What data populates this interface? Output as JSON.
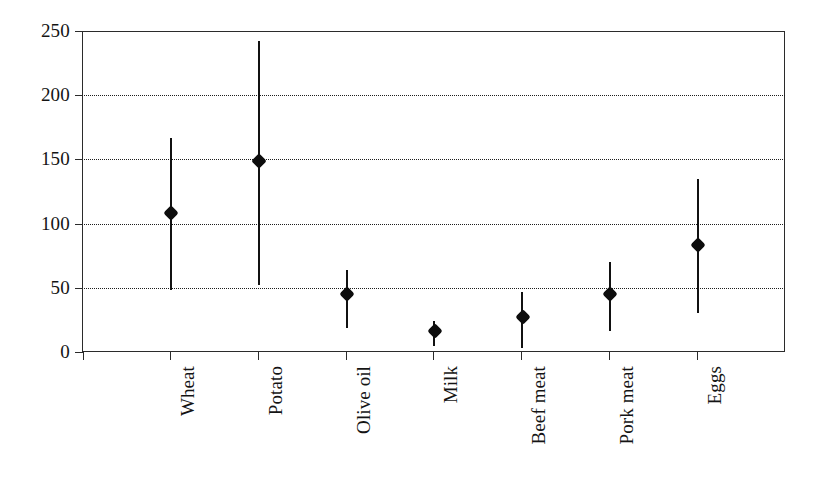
{
  "chart_data": {
    "type": "scatter",
    "title": "",
    "subtitle": "",
    "xlabel": "",
    "ylabel": "",
    "ylim": [
      0,
      250
    ],
    "yticks": [
      0,
      50,
      100,
      150,
      200,
      250
    ],
    "grid": true,
    "legend": null,
    "categories": [
      "Wheat",
      "Potato",
      "Olive oil",
      "Milk",
      "Beef meat",
      "Pork meat",
      "Eggs"
    ],
    "values": [
      108,
      149,
      45,
      16,
      27,
      45,
      83
    ],
    "error_low": [
      48,
      52,
      19,
      5,
      3,
      16,
      30
    ],
    "error_high": [
      167,
      242,
      64,
      24,
      47,
      70,
      135
    ],
    "series": [
      {
        "name": "estimate",
        "points": [
          {
            "category": "Wheat",
            "value": 108,
            "low": 48,
            "high": 167
          },
          {
            "category": "Potato",
            "value": 149,
            "low": 52,
            "high": 242
          },
          {
            "category": "Olive oil",
            "value": 45,
            "low": 19,
            "high": 64
          },
          {
            "category": "Milk",
            "value": 16,
            "low": 5,
            "high": 24
          },
          {
            "category": "Beef meat",
            "value": 27,
            "low": 3,
            "high": 47
          },
          {
            "category": "Pork meat",
            "value": 45,
            "low": 16,
            "high": 70
          },
          {
            "category": "Eggs",
            "value": 83,
            "low": 30,
            "high": 135
          }
        ]
      }
    ],
    "marker_color": "#0d0d0d",
    "line_color": "#111111",
    "grid_color": "#1d1d1d",
    "axis_color": "#2b2b2b"
  },
  "axis": {
    "y_tick_labels": [
      "250",
      "200",
      "150",
      "100",
      "50",
      "0"
    ],
    "x_tick_labels": [
      "Wheat",
      "Potato",
      "Olive oil",
      "Milk",
      "Beef meat",
      "Pork meat",
      "Eggs"
    ]
  }
}
